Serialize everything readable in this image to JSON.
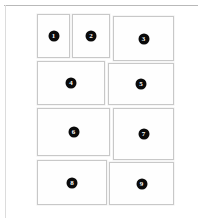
{
  "page": {
    "background_color": "#ffffff",
    "rule_color": "#b9b9b9",
    "left_rule_color": "#dcdcdc"
  },
  "grid": {
    "card_border_color": "#c8c8c8",
    "card_fill_color": "#fefefe",
    "badge_fill_color": "#0a0a0a",
    "badge_text_color": "#ffffff",
    "cards": [
      {
        "label": "1",
        "x": 37,
        "y": 14,
        "w": 33,
        "h": 44
      },
      {
        "label": "2",
        "x": 72,
        "y": 14,
        "w": 38,
        "h": 44
      },
      {
        "label": "3",
        "x": 113,
        "y": 16,
        "w": 61,
        "h": 45
      },
      {
        "label": "4",
        "x": 37,
        "y": 61,
        "w": 68,
        "h": 44
      },
      {
        "label": "5",
        "x": 108,
        "y": 63,
        "w": 66,
        "h": 42
      },
      {
        "label": "6",
        "x": 37,
        "y": 108,
        "w": 73,
        "h": 48
      },
      {
        "label": "7",
        "x": 113,
        "y": 108,
        "w": 61,
        "h": 52
      },
      {
        "label": "8",
        "x": 37,
        "y": 160,
        "w": 70,
        "h": 45
      },
      {
        "label": "9",
        "x": 109,
        "y": 162,
        "w": 65,
        "h": 43
      }
    ]
  }
}
